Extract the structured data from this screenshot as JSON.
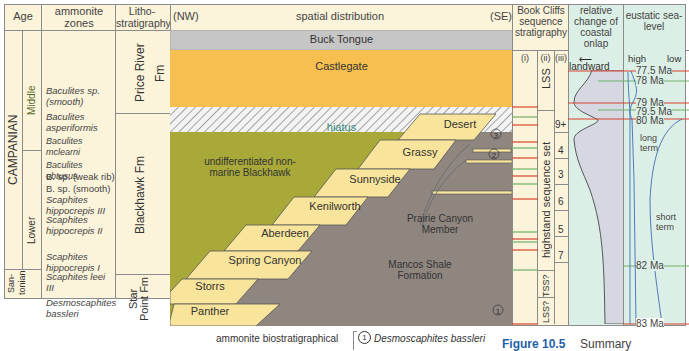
{
  "headers": {
    "age": "Age",
    "ammonite_zones": "ammonite zones",
    "lithostratigraphy": "Litho-stratigraphy",
    "nw": "(NW)",
    "spatial": "spatial distribution",
    "se": "(SE)",
    "book_cliffs": "Book Cliffs sequence stratigraphy",
    "onlap": "relative change of coastal onlap",
    "sealevel": "eustatic sea-level"
  },
  "age": {
    "stage": "CAMPANIAN",
    "middle": "Middle",
    "lower": "Lower",
    "santonian": "San-tonian"
  },
  "ammonite_zones": [
    "Baculites sp. (smooth)",
    "Baculites asperiformis",
    "Baculites mclearni",
    "Baculites obtusus",
    "B. sp. (weak rib)",
    "B. sp. (smooth)",
    "Scaphites hippocrepis III",
    "Scaphites hippocrepis II",
    "Scaphites hippocrepis I",
    "Scaphites leei III",
    "Desmoscaphites bassleri"
  ],
  "formations": {
    "price_river": "Price River Fm",
    "blackhawk": "Blackhawk Fm",
    "star_point": "Star Point Fm"
  },
  "units": {
    "buck_tongue": "Buck Tongue",
    "castlegate": "Castlegate",
    "hiatus": "hiatus",
    "undiff": "undifferentiated non-marine Blackhawk",
    "mancos": "Mancos Shale Formation",
    "prairie": "Prairie Canyon Member",
    "parasequences": [
      "Desert",
      "Grassy",
      "Sunnyside",
      "Kenilworth",
      "Aberdeen",
      "Spring Canyon",
      "Storrs",
      "Panther"
    ],
    "markers": [
      "1",
      "2",
      "3"
    ]
  },
  "sequence": {
    "col_i": "(i)",
    "col_ii": "(ii)",
    "col_iii": "(iii)",
    "lss": "LSS",
    "hss": "highstand sequence set",
    "tss": "TSS?",
    "lss_q": "LSS?",
    "numbers": [
      "9+",
      "4",
      "3",
      "6",
      "5",
      "7"
    ]
  },
  "onlap": {
    "arrow_label": "landward"
  },
  "sealevel": {
    "high": "high",
    "low": "low",
    "ages": [
      "77.5 Ma",
      "78 Ma",
      "79 Ma",
      "79.5 Ma",
      "80 Ma",
      "82 Ma",
      "83 Ma"
    ],
    "long_term": "long term",
    "short_term": "short term"
  },
  "footer": {
    "biostrat": "ammonite biostratigraphical",
    "legend_1": "Desmoscaphites bassleri",
    "legend_num": "1",
    "figure": "Figure 10.5",
    "caption": "Summary"
  },
  "colors": {
    "buck": "#c6c6c6",
    "castlegate": "#f6bf4f",
    "blackhawk": "#a9a93a",
    "mancos": "#8f8680",
    "parasequence": "#f8e49a",
    "red_line": "#d9432f",
    "green_line": "#6fb26a",
    "figure_blue": "#1f5fa8"
  }
}
